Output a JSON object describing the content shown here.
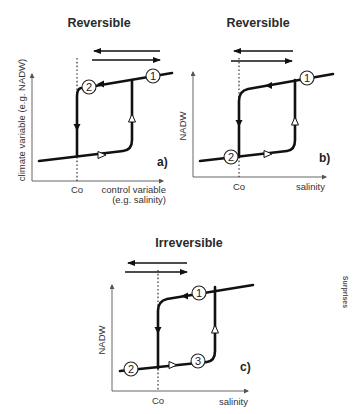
{
  "panels": [
    {
      "id": "a",
      "title": "Reversible",
      "panel_label": "a)",
      "y_axis_label": "climate variable (e.g. NADW)",
      "x_axis_label_line1": "control variable",
      "x_axis_label_line2": "(e.g. salinity)",
      "threshold_label": "Co",
      "states": [
        "1",
        "2"
      ]
    },
    {
      "id": "b",
      "title": "Reversible",
      "panel_label": "b)",
      "y_axis_label": "NADW",
      "x_axis_label": "salinity",
      "threshold_label": "Co",
      "states": [
        "1",
        "2"
      ]
    },
    {
      "id": "c",
      "title": "Irreversible",
      "panel_label": "c)",
      "y_axis_label": "NADW",
      "x_axis_label": "salinity",
      "threshold_label": "Co",
      "states": [
        "1",
        "2",
        "3"
      ]
    }
  ],
  "side_label": "Surprises"
}
